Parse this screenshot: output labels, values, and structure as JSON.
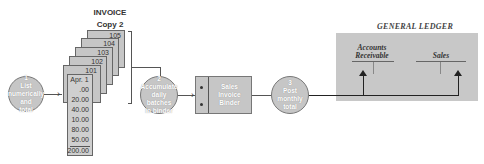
{
  "invoice": {
    "title": "INVOICE",
    "subtitle": "Copy 2",
    "doc_numbers": [
      "105",
      "104",
      "103",
      "102",
      "101"
    ],
    "front_date": "Apr. 1",
    "amounts": [
      ".00",
      "20.00",
      "40.00",
      "10.00",
      "80.00",
      "50.00"
    ],
    "total": "200.00"
  },
  "steps": [
    {
      "number": "1",
      "lines": [
        "List",
        "numerically",
        "and",
        "total"
      ]
    },
    {
      "number": "2",
      "lines": [
        "Accumulate",
        "daily batches",
        "in binder"
      ]
    },
    {
      "number": "3",
      "lines": [
        "Post",
        "monthly",
        "total"
      ]
    }
  ],
  "binder": {
    "lines": [
      "Sales",
      "Invoice",
      "Binder"
    ]
  },
  "ledger": {
    "title": "GENERAL LEDGER",
    "accounts": [
      {
        "lines": [
          "Accounts",
          "Receivable"
        ]
      },
      {
        "lines": [
          "Sales"
        ]
      }
    ]
  },
  "colors": {
    "fill_gray": "#c6c6c6",
    "line": "#555555"
  }
}
